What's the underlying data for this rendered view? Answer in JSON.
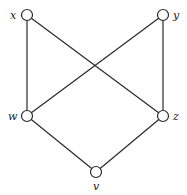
{
  "diagram": {
    "type": "graph",
    "nodes": [
      {
        "id": "x",
        "label": "x",
        "cx": 27,
        "cy": 15,
        "lx": 10,
        "ly": 19
      },
      {
        "id": "y",
        "label": "y",
        "cx": 163,
        "cy": 15,
        "lx": 173,
        "ly": 19
      },
      {
        "id": "w",
        "label": "w",
        "cx": 27,
        "cy": 116,
        "lx": 8,
        "ly": 120
      },
      {
        "id": "z",
        "label": "z",
        "cx": 163,
        "cy": 116,
        "lx": 173,
        "ly": 120
      },
      {
        "id": "v",
        "label": "v",
        "cx": 96,
        "cy": 172,
        "lx": 93,
        "ly": 190
      }
    ],
    "edges": [
      {
        "from": "x",
        "to": "w"
      },
      {
        "from": "x",
        "to": "z"
      },
      {
        "from": "y",
        "to": "w"
      },
      {
        "from": "y",
        "to": "z"
      },
      {
        "from": "w",
        "to": "v"
      },
      {
        "from": "z",
        "to": "v"
      }
    ],
    "node_radius": 5.5,
    "colors": {
      "stroke": "#2a2a2a",
      "fill": "#ffffff",
      "background": "#ffffff"
    }
  }
}
